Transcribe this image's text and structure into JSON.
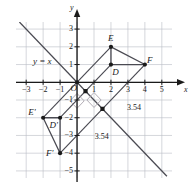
{
  "figure": {
    "kind": "coordinate-grid-geometry-diagram",
    "line_label": "y = x",
    "origin_label": "O",
    "axis_names": {
      "x": "x",
      "y": "y"
    },
    "grid": {
      "x_min": -3.6,
      "x_max": 5.6,
      "y_min": -5.4,
      "y_max": 3.4,
      "step": 1,
      "grid_color": "#b9bcc4",
      "axis_color": "#1a1a1a",
      "shape_color": "#4a4a52"
    },
    "x_ticks": [
      "-3",
      "-2",
      "-1",
      "1",
      "2",
      "3",
      "4",
      "5"
    ],
    "y_ticks": [
      "3",
      "2",
      "1",
      "-1",
      "-2",
      "-3",
      "-4",
      "-5"
    ],
    "points": [
      {
        "name": "E",
        "label": "E",
        "x": 2,
        "y": 2,
        "lx": 2,
        "ly": 2.45
      },
      {
        "name": "D",
        "label": "D",
        "x": 2,
        "y": 1,
        "lx": 2.25,
        "ly": 0.55
      },
      {
        "name": "F",
        "label": "F",
        "x": 4,
        "y": 1,
        "lx": 4.3,
        "ly": 1.2
      },
      {
        "name": "Ep",
        "label": "E'",
        "x": -2,
        "y": -2,
        "lx": -2.7,
        "ly": -1.75
      },
      {
        "name": "Dp",
        "label": "D'",
        "x": -1,
        "y": -2,
        "lx": -1.45,
        "ly": -2.45
      },
      {
        "name": "Fp",
        "label": "F'",
        "x": -1,
        "y": -4,
        "lx": -1.65,
        "ly": -4.05
      }
    ],
    "midpoints": [
      {
        "x": 0.5,
        "y": -0.5
      },
      {
        "x": 1.5,
        "y": -1.5
      }
    ],
    "triangles": [
      {
        "name": "DEF",
        "vertices": [
          [
            2,
            2
          ],
          [
            2,
            1
          ],
          [
            4,
            1
          ]
        ]
      },
      {
        "name": "D'E'F'",
        "vertices": [
          [
            -2,
            -2
          ],
          [
            -1,
            -2
          ],
          [
            -1,
            -4
          ]
        ]
      }
    ],
    "connectors": [
      {
        "from": [
          2,
          2
        ],
        "to": [
          -2,
          -2
        ],
        "length_label": "3.54"
      },
      {
        "from": [
          2,
          1
        ],
        "to": [
          -1,
          -2
        ],
        "length_label": "3.54"
      },
      {
        "from": [
          4,
          1
        ],
        "to": [
          -1,
          -4
        ],
        "length_label": null
      }
    ],
    "distance_labels": [
      {
        "text": "3.54",
        "x": 2.95,
        "y": -1.45
      },
      {
        "text": "3.54",
        "x": 1.05,
        "y": -3.1
      }
    ],
    "reflection_line": {
      "from": [
        -3.4,
        3.4
      ],
      "to": [
        5.3,
        -5.3
      ]
    },
    "right_angle_marks": [
      {
        "x": 1.0,
        "y": -1.0,
        "size": 0.42
      },
      {
        "x": 0.0,
        "y": -1.05,
        "size": 0.42
      }
    ],
    "line_label_pos": {
      "x": -2.6,
      "y": 1.45
    }
  }
}
